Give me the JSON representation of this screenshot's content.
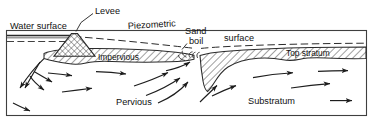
{
  "figure": {
    "type": "engineering-cross-section",
    "frame": {
      "stroke": "#3a3a3a",
      "fill": "#ffffff"
    }
  },
  "labels": {
    "water_surface": "Water surface",
    "levee": "Levee",
    "piezometric": "Piezometric",
    "surface": "surface",
    "sand": "Sand",
    "boil": "boil",
    "impervious": "Impervious",
    "top_stratum": "Top stratum",
    "pervious": "Pervious",
    "substratum": "Substratum"
  },
  "colors": {
    "ink": "#111111",
    "line": "#2b2b2b",
    "frame": "#3f3f3f",
    "hatch": "#2b2b2b",
    "water": "#8a8a8a"
  },
  "strata": {
    "top_stratum_fill": "#ffffff",
    "top_stratum_hatch": "diagonal-45",
    "levee_hatch": "cross-hatch",
    "substratum_fill": "#ffffff"
  },
  "annotations": {
    "leader_lines": [
      "levee-leader",
      "sand-boil-leader"
    ],
    "flow_arrow_count": 16,
    "piezometric_style": "dashed",
    "water_surface_style": "solid-with-dashed-below"
  }
}
